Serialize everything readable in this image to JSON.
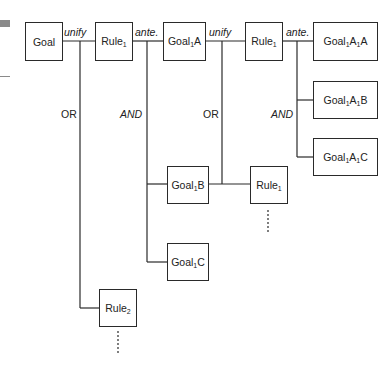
{
  "nodes": {
    "goal": {
      "label": "Goal"
    },
    "rule1_a": {
      "label": "Rule",
      "sub": "1"
    },
    "goal1a": {
      "pre": "Goal",
      "sub": "1",
      "post": "A"
    },
    "rule1_b": {
      "label": "Rule",
      "sub": "1"
    },
    "goal1a1a": {
      "pre": "Goal",
      "sub1": "1",
      "mid": "A",
      "sub2": "1",
      "post": "A"
    },
    "goal1a1b": {
      "pre": "Goal",
      "sub1": "1",
      "mid": "A",
      "sub2": "1",
      "post": "B"
    },
    "goal1a1c": {
      "pre": "Goal",
      "sub1": "1",
      "mid": "A",
      "sub2": "1",
      "post": "C"
    },
    "goal1b": {
      "pre": "Goal",
      "sub": "1",
      "post": "B"
    },
    "rule1_c": {
      "label": "Rule",
      "sub": "1"
    },
    "goal1c": {
      "pre": "Goal",
      "sub": "1",
      "post": "C"
    },
    "rule2": {
      "label": "Rule",
      "sub": "2"
    }
  },
  "edge_labels": {
    "unify_1": "unify",
    "ante_1": "ante.",
    "unify_2": "unify",
    "ante_2": "ante.",
    "or_1": "OR",
    "and_1": "AND",
    "or_2": "OR",
    "and_2": "AND"
  }
}
